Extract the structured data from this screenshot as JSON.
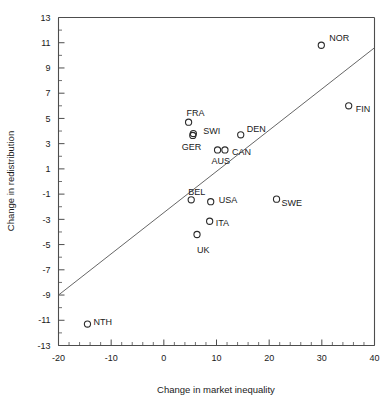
{
  "chart_data": {
    "type": "scatter",
    "title": "",
    "xlabel": "Change in market inequality",
    "ylabel": "Change in redistribution",
    "xlim": [
      -20,
      40
    ],
    "ylim": [
      -13,
      13
    ],
    "xticks": [
      -20,
      -10,
      0,
      10,
      20,
      30,
      40
    ],
    "xtick_labels": [
      "-20",
      "-10",
      "0",
      "10",
      "20",
      "30",
      "40"
    ],
    "yticks": [
      -13,
      -11,
      -9,
      -7,
      -5,
      -3,
      -1,
      1,
      3,
      5,
      7,
      9,
      11,
      13
    ],
    "ytick_labels": [
      "-13",
      "-11",
      "-9",
      "-7",
      "-5",
      "-3",
      "-1",
      "1",
      "3",
      "5",
      "7",
      "9",
      "11",
      "13"
    ],
    "x_minor_step": 2,
    "y_minor_step": 1,
    "grid": false,
    "legend": "none",
    "marker_style": "open-circle",
    "points": [
      {
        "label": "NOR",
        "x": 29.9,
        "y": 10.8,
        "label_dx": 8,
        "label_dy": -7
      },
      {
        "label": "FIN",
        "x": 35.1,
        "y": 6.0,
        "label_dx": 7,
        "label_dy": 3
      },
      {
        "label": "FRA",
        "x": 4.7,
        "y": 4.7,
        "label_dx": -2,
        "label_dy": -9
      },
      {
        "label": "SWI",
        "x": 5.6,
        "y": 3.8,
        "label_dx": 10,
        "label_dy": -3
      },
      {
        "label": "GER",
        "x": 5.5,
        "y": 3.65,
        "label_dx": -11,
        "label_dy": 11
      },
      {
        "label": "DEN",
        "x": 14.6,
        "y": 3.7,
        "label_dx": 6,
        "label_dy": -6
      },
      {
        "label": "CAN",
        "x": 11.6,
        "y": 2.5,
        "label_dx": 7,
        "label_dy": 2
      },
      {
        "label": "AUS",
        "x": 10.2,
        "y": 2.5,
        "label_dx": -6,
        "label_dy": 11
      },
      {
        "label": "BEL",
        "x": 5.2,
        "y": -1.45,
        "label_dx": -3,
        "label_dy": -8
      },
      {
        "label": "USA",
        "x": 8.9,
        "y": -1.6,
        "label_dx": 8,
        "label_dy": -2
      },
      {
        "label": "SWE",
        "x": 21.4,
        "y": -1.4,
        "label_dx": 5,
        "label_dy": 4
      },
      {
        "label": "ITA",
        "x": 8.7,
        "y": -3.15,
        "label_dx": 6,
        "label_dy": 2
      },
      {
        "label": "UK",
        "x": 6.3,
        "y": -4.2,
        "label_dx": 0,
        "label_dy": 15
      },
      {
        "label": "NTH",
        "x": -14.5,
        "y": -11.3,
        "label_dx": 6,
        "label_dy": -2
      }
    ],
    "fit_line": {
      "x0": -20,
      "y0": -9.0,
      "x1": 40,
      "y1": 10.6
    }
  }
}
